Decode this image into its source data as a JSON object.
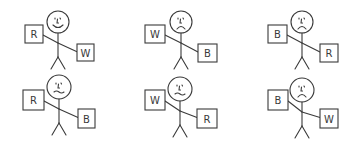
{
  "colors": {
    "background": "#ffffff",
    "ink": "#3a3a3a"
  },
  "figures": [
    {
      "id": "figure-1",
      "row": 1,
      "col": 1,
      "expression": "happy",
      "head": {
        "cx": 58,
        "cy": 22,
        "r": 11
      },
      "left_card": {
        "label": "R",
        "x": 25,
        "y": 25,
        "w": 18,
        "h": 18
      },
      "right_card": {
        "label": "W",
        "x": 77,
        "y": 44,
        "w": 17,
        "h": 17
      }
    },
    {
      "id": "figure-2",
      "row": 1,
      "col": 2,
      "expression": "sad",
      "head": {
        "cx": 181,
        "cy": 22,
        "r": 11
      },
      "left_card": {
        "label": "W",
        "x": 145,
        "y": 25,
        "w": 20,
        "h": 18
      },
      "right_card": {
        "label": "B",
        "x": 198,
        "y": 44,
        "w": 19,
        "h": 18
      }
    },
    {
      "id": "figure-3",
      "row": 1,
      "col": 3,
      "expression": "sad",
      "head": {
        "cx": 302,
        "cy": 22,
        "r": 11
      },
      "left_card": {
        "label": "B",
        "x": 268,
        "y": 25,
        "w": 19,
        "h": 18
      },
      "right_card": {
        "label": "R",
        "x": 320,
        "y": 44,
        "w": 18,
        "h": 18
      }
    },
    {
      "id": "figure-4",
      "row": 2,
      "col": 1,
      "expression": "neutral",
      "head": {
        "cx": 59,
        "cy": 87,
        "r": 12
      },
      "left_card": {
        "label": "R",
        "x": 23,
        "y": 90,
        "w": 21,
        "h": 20
      },
      "right_card": {
        "label": "B",
        "x": 78,
        "y": 109,
        "w": 17,
        "h": 19
      }
    },
    {
      "id": "figure-5",
      "row": 2,
      "col": 2,
      "expression": "neutral",
      "head": {
        "cx": 180,
        "cy": 89,
        "r": 12
      },
      "left_card": {
        "label": "W",
        "x": 145,
        "y": 90,
        "w": 20,
        "h": 20
      },
      "right_card": {
        "label": "R",
        "x": 197,
        "y": 109,
        "w": 20,
        "h": 19
      }
    },
    {
      "id": "figure-6",
      "row": 2,
      "col": 3,
      "expression": "sad",
      "head": {
        "cx": 302,
        "cy": 90,
        "r": 12
      },
      "left_card": {
        "label": "B",
        "x": 268,
        "y": 90,
        "w": 20,
        "h": 20
      },
      "right_card": {
        "label": "W",
        "x": 320,
        "y": 109,
        "w": 18,
        "h": 19
      }
    }
  ]
}
